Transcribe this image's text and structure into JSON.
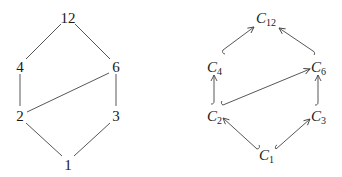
{
  "left_diagram": {
    "title": "Hasse diagram of divisors of 12",
    "nodes": [
      {
        "id": "12",
        "label": "12",
        "x": 68,
        "y": 18
      },
      {
        "id": "4",
        "label": "4",
        "x": 20,
        "y": 67
      },
      {
        "id": "6",
        "label": "6",
        "x": 116,
        "y": 67
      },
      {
        "id": "2",
        "label": "2",
        "x": 20,
        "y": 116
      },
      {
        "id": "3",
        "label": "3",
        "x": 116,
        "y": 116
      },
      {
        "id": "1",
        "label": "1",
        "x": 68,
        "y": 165
      }
    ],
    "edges": [
      [
        "12",
        "4"
      ],
      [
        "12",
        "6"
      ],
      [
        "4",
        "2"
      ],
      [
        "6",
        "2"
      ],
      [
        "6",
        "3"
      ],
      [
        "2",
        "1"
      ],
      [
        "3",
        "1"
      ]
    ]
  },
  "right_diagram": {
    "title": "Inclusion diagram of cyclic groups",
    "nodes": [
      {
        "id": "C12",
        "base": "C",
        "sub": "12",
        "x": 265,
        "y": 18
      },
      {
        "id": "C4",
        "base": "C",
        "sub": "4",
        "x": 214,
        "y": 67
      },
      {
        "id": "C6",
        "base": "C",
        "sub": "6",
        "x": 318,
        "y": 67
      },
      {
        "id": "C2",
        "base": "C",
        "sub": "2",
        "x": 214,
        "y": 116
      },
      {
        "id": "C3",
        "base": "C",
        "sub": "3",
        "x": 318,
        "y": 116
      },
      {
        "id": "C1",
        "base": "C",
        "sub": "1",
        "x": 265,
        "y": 165
      }
    ],
    "arrows": [
      {
        "from": "C4",
        "to": "C12",
        "style": "hook-arrow"
      },
      {
        "from": "C6",
        "to": "C12",
        "style": "hook-arrow"
      },
      {
        "from": "C2",
        "to": "C4",
        "style": "hook-arrow"
      },
      {
        "from": "C2",
        "to": "C6",
        "style": "hook-arrow"
      },
      {
        "from": "C3",
        "to": "C6",
        "style": "hook-arrow"
      },
      {
        "from": "C1",
        "to": "C2",
        "style": "hook-arrow"
      },
      {
        "from": "C1",
        "to": "C3",
        "style": "hook-arrow"
      }
    ]
  },
  "colors": {
    "ink": "#1a1a1a",
    "edge": "#444444",
    "background": "#ffffff"
  }
}
